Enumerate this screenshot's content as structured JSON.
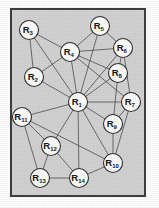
{
  "figure": {
    "panel": {
      "x": 10,
      "y": 8,
      "width": 136,
      "height": 189,
      "fill": "#d2d2d2",
      "stroke": "#3a3a3a"
    },
    "node_radius": 9.5,
    "node_fill": "#fdfdfd",
    "node_stroke": "#2b2b2b",
    "edge_color": "#4a4a4a"
  },
  "chart_data": {
    "type": "diagram",
    "node_count": 14,
    "edge_count": 32,
    "nodes": [
      {
        "id": "R1",
        "base": "R",
        "sub": "1",
        "x": 78,
        "y": 102
      },
      {
        "id": "R2",
        "base": "R",
        "sub": "2",
        "x": 34,
        "y": 77
      },
      {
        "id": "R3",
        "base": "R",
        "sub": "3",
        "x": 29,
        "y": 30
      },
      {
        "id": "R4",
        "base": "R",
        "sub": "4",
        "x": 70,
        "y": 52
      },
      {
        "id": "R5",
        "base": "R",
        "sub": "5",
        "x": 100,
        "y": 26
      },
      {
        "id": "R6",
        "base": "R",
        "sub": "6",
        "x": 123,
        "y": 48
      },
      {
        "id": "R7",
        "base": "R",
        "sub": "7",
        "x": 131,
        "y": 102
      },
      {
        "id": "R8",
        "base": "R",
        "sub": "8",
        "x": 118,
        "y": 73
      },
      {
        "id": "R9",
        "base": "R",
        "sub": "9",
        "x": 113,
        "y": 124
      },
      {
        "id": "R10",
        "base": "R",
        "sub": "10",
        "x": 113,
        "y": 163
      },
      {
        "id": "R11",
        "base": "R",
        "sub": "11",
        "x": 22,
        "y": 117
      },
      {
        "id": "R12",
        "base": "R",
        "sub": "12",
        "x": 51,
        "y": 146
      },
      {
        "id": "R13",
        "base": "R",
        "sub": "13",
        "x": 40,
        "y": 178
      },
      {
        "id": "R14",
        "base": "R",
        "sub": "14",
        "x": 79,
        "y": 178
      }
    ],
    "edges": [
      {
        "from": "R1",
        "to": "R2"
      },
      {
        "from": "R1",
        "to": "R3"
      },
      {
        "from": "R1",
        "to": "R4"
      },
      {
        "from": "R1",
        "to": "R5"
      },
      {
        "from": "R1",
        "to": "R6"
      },
      {
        "from": "R1",
        "to": "R7"
      },
      {
        "from": "R1",
        "to": "R8"
      },
      {
        "from": "R1",
        "to": "R9"
      },
      {
        "from": "R1",
        "to": "R10"
      },
      {
        "from": "R1",
        "to": "R11"
      },
      {
        "from": "R1",
        "to": "R12"
      },
      {
        "from": "R1",
        "to": "R14"
      },
      {
        "from": "R2",
        "to": "R3"
      },
      {
        "from": "R2",
        "to": "R4"
      },
      {
        "from": "R3",
        "to": "R4"
      },
      {
        "from": "R4",
        "to": "R5"
      },
      {
        "from": "R4",
        "to": "R6"
      },
      {
        "from": "R4",
        "to": "R8"
      },
      {
        "from": "R4",
        "to": "R7"
      },
      {
        "from": "R5",
        "to": "R6"
      },
      {
        "from": "R6",
        "to": "R7"
      },
      {
        "from": "R6",
        "to": "R8"
      },
      {
        "from": "R7",
        "to": "R9"
      },
      {
        "from": "R7",
        "to": "R10"
      },
      {
        "from": "R8",
        "to": "R9"
      },
      {
        "from": "R9",
        "to": "R10"
      },
      {
        "from": "R10",
        "to": "R14"
      },
      {
        "from": "R11",
        "to": "R12"
      },
      {
        "from": "R11",
        "to": "R13"
      },
      {
        "from": "R11",
        "to": "R10"
      },
      {
        "from": "R12",
        "to": "R13"
      },
      {
        "from": "R12",
        "to": "R14"
      },
      {
        "from": "R13",
        "to": "R14"
      }
    ]
  }
}
